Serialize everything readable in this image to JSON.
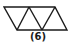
{
  "figure": {
    "label": "(6)",
    "stroke_color": "#1a1a1a",
    "outline": [
      [
        4,
        7
      ],
      [
        55,
        7
      ],
      [
        67,
        30
      ],
      [
        17,
        30
      ]
    ],
    "diagonals": [
      [
        [
          17,
          30
        ],
        [
          29,
          7
        ]
      ],
      [
        [
          29,
          7
        ],
        [
          42,
          30
        ]
      ],
      [
        [
          42,
          30
        ],
        [
          55,
          7
        ]
      ]
    ]
  }
}
